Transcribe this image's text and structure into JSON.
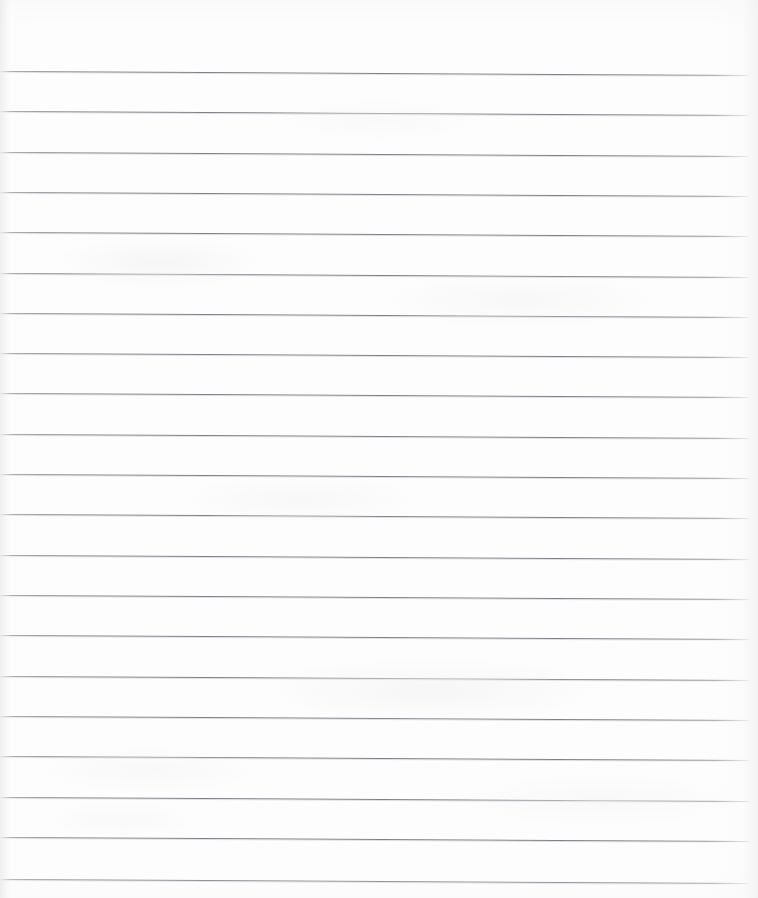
{
  "document": {
    "kind": "scanned-lined-paper",
    "title": "Blank ruled notepad page",
    "page_width_px": 758,
    "page_height_px": 898,
    "background_color": "#fdfdfd",
    "has_text_content": false,
    "handwriting_present": "none",
    "printed_text_present": "none"
  },
  "ruling": {
    "line_color": "#808088",
    "line_thickness_px": 1.3,
    "line_count": 21,
    "line_spacing_px": 40.3,
    "first_line_y_px": 71,
    "last_line_y_px": 879,
    "line_start_x_px": 0,
    "line_end_x_px": 751,
    "skew_degrees": 0.305,
    "top_margin_px": 71,
    "left_margin_rule": "none",
    "line_y_positions": [
      71,
      111,
      152,
      192,
      232,
      273,
      313,
      353,
      393,
      434,
      474,
      514,
      555,
      595,
      635,
      676,
      716,
      756,
      797,
      837,
      879
    ]
  },
  "scan": {
    "edge_shadow_left": "#ececee",
    "edge_shadow_right": "#efeff1",
    "noise_tint": "#f4f4f6"
  }
}
